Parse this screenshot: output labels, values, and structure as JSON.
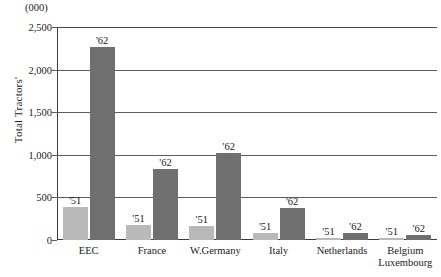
{
  "chart_data": {
    "type": "bar",
    "title": "",
    "subtitle": "",
    "units_caption": "(000)",
    "xlabel": "",
    "ylabel": "Total Tractors'",
    "ylim": [
      0,
      2500
    ],
    "yticks": [
      0,
      500,
      1000,
      1500,
      2000,
      2500
    ],
    "ytick_labels": [
      "0",
      "500",
      "1,000",
      "1,500",
      "2,000",
      "2,500"
    ],
    "grid": true,
    "legend": "none",
    "categories": [
      "EEC",
      "France",
      "W.Germany",
      "Italy",
      "Netherlands",
      "Belgium Luxembourg"
    ],
    "category_lines": [
      [
        "EEC"
      ],
      [
        "France"
      ],
      [
        "W.Germany"
      ],
      [
        "Italy"
      ],
      [
        "Netherlands"
      ],
      [
        "Belgium",
        "Luxembourg"
      ]
    ],
    "series": [
      {
        "name": "'51",
        "color": "#b9b9b9",
        "values": [
          390,
          180,
          160,
          85,
          22,
          18
        ]
      },
      {
        "name": "'62",
        "color": "#6f6f6f",
        "values": [
          2260,
          830,
          1020,
          370,
          78,
          62
        ]
      }
    ],
    "bar_labels": [
      [
        "'51",
        "'62"
      ],
      [
        "'51",
        "'62"
      ],
      [
        "'51",
        "'62"
      ],
      [
        "'51",
        "'62"
      ],
      [
        "'51",
        "'62"
      ],
      [
        "'51",
        "'62"
      ]
    ]
  },
  "colors": {
    "series_51": "#b9b9b9",
    "series_62": "#6f6f6f",
    "grid": "#5c5c5c",
    "axis": "#3d3d3d",
    "text": "#1a1a1a",
    "background": "#ffffff"
  }
}
